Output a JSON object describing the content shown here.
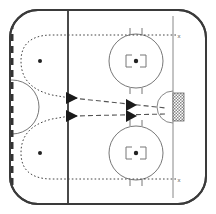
{
  "diagram": {
    "surface_color": "#ffffff",
    "line_color": "#555555",
    "boundary_color": "#3a3a3a",
    "blue_line_color": "#4a4a4a",
    "goal_line_color": "#777777",
    "center_line_color": "#333333",
    "net_color": "#666666",
    "view": "offensive-zone-right-half"
  },
  "rink": {
    "boundary": {
      "name": "rink-boundary",
      "x": 10,
      "y": 10,
      "width": 196,
      "height": 194,
      "corner_radius": 28,
      "stroke_width": 2.0
    },
    "center_line": {
      "name": "center-red-line",
      "x": 12,
      "y_top": 11,
      "y_bottom": 203,
      "stroke_width": 3.0,
      "dash": "7,5"
    },
    "center_circle": {
      "name": "center-faceoff-circle",
      "cx": 12,
      "cy": 107,
      "r": 27
    },
    "blue_line": {
      "name": "blue-line",
      "x": 68,
      "y_top": 11,
      "y_bottom": 203,
      "stroke_width": 2.0
    },
    "goal_line": {
      "name": "goal-line",
      "x": 173,
      "y_top": 24,
      "y_bottom": 190,
      "stroke_width": 1.0
    }
  },
  "faceoff_circles": [
    {
      "name": "faceoff-circle-top-right",
      "cx": 136,
      "cy": 61,
      "r": 27,
      "dot_r": 2.2,
      "hash_len": 6
    },
    {
      "name": "faceoff-circle-bottom-right",
      "cx": 136,
      "cy": 153,
      "r": 27,
      "dot_r": 2.2,
      "hash_len": 6
    }
  ],
  "faceoff_dots": [
    {
      "name": "neutral-zone-dot-top",
      "cx": 40,
      "cy": 61,
      "r": 2.0
    },
    {
      "name": "neutral-zone-dot-bottom",
      "cx": 40,
      "cy": 153,
      "r": 2.0
    }
  ],
  "goal": {
    "crease": {
      "name": "goal-crease",
      "cx": 173,
      "cy": 107,
      "r": 16
    },
    "net": {
      "name": "goal-net",
      "x": 173,
      "y": 94,
      "width": 11,
      "height": 27
    }
  },
  "markers": [
    {
      "name": "marker-x-top",
      "label": "x",
      "x": 181,
      "y": 36
    },
    {
      "name": "marker-x-bottom",
      "label": "x",
      "x": 181,
      "y": 180
    }
  ],
  "paths": {
    "skate_routes": [
      {
        "name": "skate-route-top",
        "style": "dotted",
        "d": "M 173 35 L 52 35 C 26 35 22 48 22 61 C 22 74 26 88 52 93 L 72 97"
      },
      {
        "name": "skate-route-bottom",
        "style": "dotted",
        "d": "M 173 179 L 52 179 C 26 179 22 166 22 153 C 22 140 26 126 52 121 L 72 117"
      }
    ],
    "pass_routes": [
      {
        "name": "pass-route-top",
        "style": "dashed",
        "d": "M 74 97 L 165 108"
      },
      {
        "name": "pass-route-bottom",
        "style": "dashed",
        "d": "M 74 117 L 165 116"
      }
    ],
    "arrowheads": [
      {
        "name": "arrowhead-blue-line-top",
        "x": 72,
        "y": 97,
        "angle": 7
      },
      {
        "name": "arrowhead-blue-line-bottom",
        "x": 72,
        "y": 117,
        "angle": -7
      },
      {
        "name": "arrowhead-mid-top",
        "x": 134,
        "y": 104,
        "angle": 7
      },
      {
        "name": "arrowhead-mid-bottom",
        "x": 134,
        "y": 116,
        "angle": -4
      }
    ]
  }
}
